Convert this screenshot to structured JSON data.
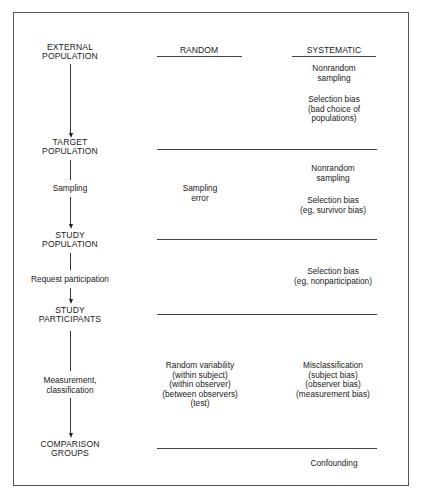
{
  "columns": {
    "random": "RANDOM",
    "systematic": "SYSTEMATIC"
  },
  "stages": [
    {
      "line1": "EXTERNAL",
      "line2": "POPULATION"
    },
    {
      "line1": "TARGET",
      "line2": "POPULATION"
    },
    {
      "line1": "STUDY",
      "line2": "POPULATION"
    },
    {
      "line1": "STUDY",
      "line2": "PARTICIPANTS"
    },
    {
      "line1": "COMPARISON",
      "line2": "GROUPS"
    }
  ],
  "transitions": [
    {
      "label": ""
    },
    {
      "label": "Sampling"
    },
    {
      "label": "Request participation"
    },
    {
      "line1": "Measurement,",
      "line2": "classification"
    }
  ],
  "random_errors": {
    "sampling": {
      "line1": "Sampling",
      "line2": "error"
    },
    "measurement": {
      "line1": "Random variability",
      "line2": "(within subject)",
      "line3": "(within observer)",
      "line4": "(between observers)",
      "line5": "(test)"
    }
  },
  "systematic_errors": {
    "external_to_target": {
      "nonrandom": {
        "line1": "Nonrandom",
        "line2": "sampling"
      },
      "selection": {
        "line1": "Selection bias",
        "line2": "(bad choice of",
        "line3": "populations)"
      }
    },
    "target_to_study": {
      "nonrandom": {
        "line1": "Nonrandom",
        "line2": "sampling"
      },
      "selection": {
        "line1": "Selection bias",
        "line2": "(eg, survivor bias)"
      }
    },
    "study_to_participants": {
      "selection": {
        "line1": "Selection bias",
        "line2": "(eg, nonparticipation)"
      }
    },
    "participants_to_groups": {
      "misclassification": {
        "line1": "Misclassification",
        "line2": "(subject bias)",
        "line3": "(observer bias)",
        "line4": "(measurement bias)"
      }
    },
    "after_groups": {
      "label": "Confounding"
    }
  }
}
